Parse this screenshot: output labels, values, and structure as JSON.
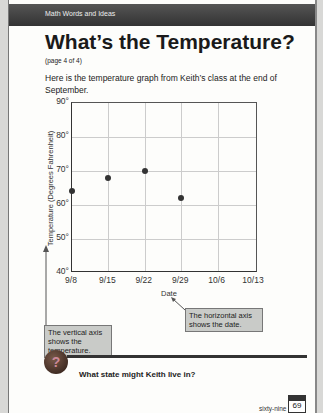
{
  "header": {
    "banner": "Math Words and Ideas",
    "title": "What’s the Temperature?",
    "subtitle": "(page 4 of 4)"
  },
  "intro": "Here is the temperature graph from Keith’s class at the end of September.",
  "chart_data": {
    "type": "scatter",
    "title": "",
    "xlabel": "Date",
    "ylabel": "Temperature (Degrees Fahrenheit)",
    "categories": [
      "9/8",
      "9/15",
      "9/22",
      "9/29",
      "10/6",
      "10/13"
    ],
    "values": [
      64,
      68,
      70,
      62,
      null,
      null
    ],
    "y_ticks": [
      "40°",
      "50°",
      "60°",
      "70°",
      "80°",
      "90°"
    ],
    "ylim": [
      40,
      90
    ],
    "grid": true
  },
  "callouts": {
    "vertical": "The vertical axis shows the temperature.",
    "horizontal": "The horizontal axis shows the date."
  },
  "question": "What state might Keith live in?",
  "footer": {
    "word": "sixty-nine",
    "page": "69"
  }
}
